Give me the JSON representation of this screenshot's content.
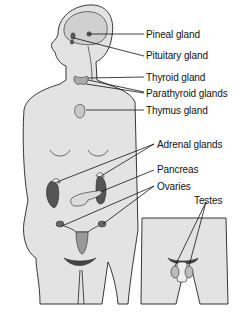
{
  "diagram": {
    "colors": {
      "skin": "#e3e3e3",
      "outline": "#222222",
      "gland_dark": "#555555",
      "gland_mid": "#9a9a9a",
      "gland_light": "#c8c8c8",
      "background": "#ffffff"
    },
    "labels": [
      {
        "id": "pineal",
        "text": "Pineal gland"
      },
      {
        "id": "pituitary",
        "text": "Pituitary gland"
      },
      {
        "id": "thyroid",
        "text": "Thyroid gland"
      },
      {
        "id": "parathyroid",
        "text": "Parathyroid glands"
      },
      {
        "id": "thymus",
        "text": "Thymus gland"
      },
      {
        "id": "adrenal",
        "text": "Adrenal glands"
      },
      {
        "id": "pancreas",
        "text": "Pancreas"
      },
      {
        "id": "ovaries",
        "text": "Ovaries"
      },
      {
        "id": "testes",
        "text": "Testes"
      }
    ]
  }
}
